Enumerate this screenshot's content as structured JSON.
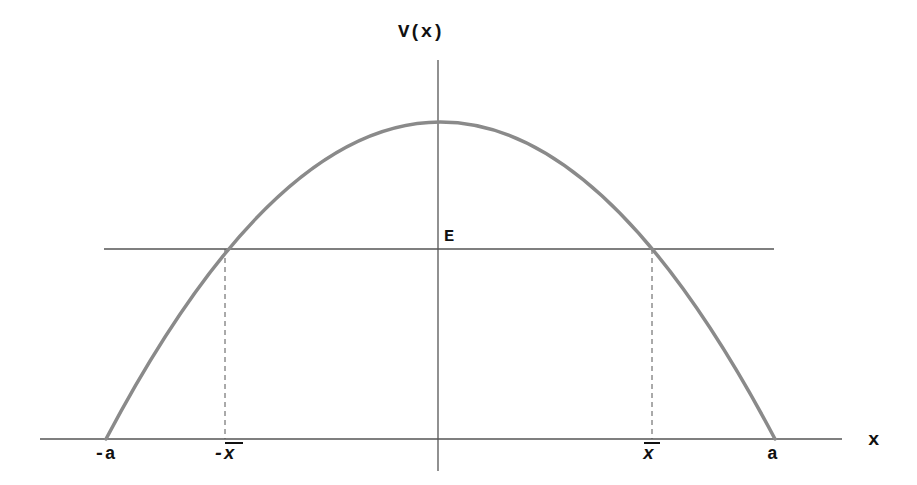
{
  "diagram": {
    "y_axis_label": "V(x)",
    "x_axis_label": "x",
    "energy_label": "E",
    "tick_labels": {
      "neg_a": "-a",
      "neg_xbar": "-x",
      "pos_xbar": "x",
      "pos_a": "a"
    },
    "colors": {
      "curve": "#8a8a8a",
      "axes": "#555555",
      "energy_line": "#555555",
      "dashed": "#555555",
      "text": "#111111"
    },
    "geometry": {
      "x_axis": {
        "x1": 40,
        "x2": 842,
        "y": 439
      },
      "y_axis": {
        "x": 438,
        "y1": 60,
        "y2": 471
      },
      "energy_line": {
        "x1": 104,
        "x2": 774,
        "y": 249
      },
      "curve": {
        "peak_x": 438,
        "peak_y": 122,
        "root_left_x": 106,
        "root_right_x": 775,
        "base_y": 439
      },
      "turning_points": {
        "left_x": 225,
        "right_x": 652
      }
    }
  }
}
